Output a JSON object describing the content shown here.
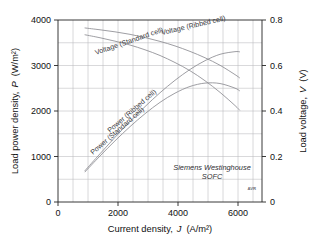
{
  "chart_data": {
    "type": "line",
    "title": "",
    "xlabel": "Current density, J  (A/m²)",
    "xlabel_parts": {
      "text": "Current density,",
      "symbol": "J",
      "units": "(A/m²)"
    },
    "ylabel_left": "Load power density,  P  (W/m²)",
    "ylabel_left_parts": {
      "text": "Load power density,",
      "symbol": "P",
      "units": "(W/m²)"
    },
    "ylabel_right": "Load voltage,  V  (V)",
    "ylabel_right_parts": {
      "text": "Load voltage,",
      "symbol": "V",
      "units": "(V)"
    },
    "xlim": [
      0,
      6800
    ],
    "ylim_left": [
      0,
      4000
    ],
    "ylim_right": [
      0,
      0.8
    ],
    "xticks": [
      0,
      2000,
      4000,
      6000
    ],
    "xticklabels": [
      "0",
      "2000",
      "4000",
      "6000"
    ],
    "yticks_left": [
      0,
      1000,
      2000,
      3000,
      4000
    ],
    "yticklabels_left": [
      "0",
      "1000",
      "2000",
      "3000",
      "4000"
    ],
    "yticks_right": [
      0,
      0.2,
      0.4,
      0.6,
      0.8
    ],
    "yticklabels_right": [
      "0",
      "0.2",
      "0.4",
      "0.6",
      "0.8"
    ],
    "grid": true,
    "grid_x_step": 500,
    "grid_y_step_left": 500,
    "legend": "inline-labels",
    "annotations": [
      {
        "name": "source-note",
        "line1": "Siemens Westinghouse",
        "line2": "SOFC"
      },
      {
        "name": "watermark",
        "text": "AVR"
      }
    ],
    "series": [
      {
        "name": "Voltage (Ribbed cell)",
        "axis": "right",
        "x": [
          900,
          1400,
          1900,
          2400,
          2900,
          3400,
          3900,
          4400,
          4900,
          5400,
          5900,
          6050
        ],
        "y": [
          0.765,
          0.757,
          0.748,
          0.737,
          0.723,
          0.706,
          0.686,
          0.662,
          0.634,
          0.601,
          0.56,
          0.546
        ]
      },
      {
        "name": "Voltage (Standard cell)",
        "axis": "right",
        "x": [
          900,
          1400,
          1900,
          2400,
          2900,
          3400,
          3900,
          4400,
          4900,
          5400,
          5900,
          6050
        ],
        "y": [
          0.735,
          0.722,
          0.707,
          0.69,
          0.669,
          0.644,
          0.613,
          0.577,
          0.533,
          0.482,
          0.424,
          0.404
        ]
      },
      {
        "name": "Power (Ribbed cell)",
        "axis": "left",
        "x": [
          900,
          1400,
          1900,
          2400,
          2900,
          3400,
          3900,
          4400,
          4900,
          5400,
          5900,
          6050
        ],
        "y": [
          690,
          1060,
          1422,
          1769,
          2096,
          2401,
          2675,
          2913,
          3106,
          3246,
          3304,
          3300
        ]
      },
      {
        "name": "Power (Standard cell)",
        "axis": "left",
        "x": [
          900,
          1400,
          1900,
          2400,
          2900,
          3400,
          3900,
          4400,
          4900,
          5400,
          5900,
          6050
        ],
        "y": [
          662,
          1011,
          1344,
          1656,
          1940,
          2190,
          2392,
          2539,
          2613,
          2604,
          2502,
          2445
        ]
      }
    ],
    "curve_labels": [
      {
        "name": "Voltage (Ribbed cell)",
        "text": "Voltage (Ribbed cell)",
        "x": 162,
        "y": 35,
        "rotate": -13
      },
      {
        "name": "Voltage (Standard cell)",
        "text": "Voltage (Standard cell)",
        "x": 96,
        "y": 55,
        "rotate": -19
      },
      {
        "name": "Power (Ribbed cell)",
        "text": "Power (Ribbed cell)",
        "x": 110,
        "y": 133,
        "rotate": -41
      },
      {
        "name": "Power (Standard cell)",
        "text": "Power (Standard cell)",
        "x": 93,
        "y": 155,
        "rotate": -41
      }
    ]
  }
}
